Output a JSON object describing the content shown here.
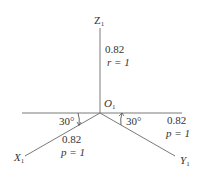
{
  "diagram": {
    "type": "axonometric-axes",
    "origin": {
      "label": "O",
      "subscript": "1"
    },
    "axes": [
      {
        "name": "Z",
        "subscript": "1",
        "scale": "0.82",
        "coef_symbol": "r",
        "coef_value": "1",
        "coef_text": "r = 1"
      },
      {
        "name": "X",
        "subscript": "1",
        "scale": "0.82",
        "coef_symbol": "p",
        "coef_value": "1",
        "coef_text": "p = 1"
      },
      {
        "name": "Y",
        "subscript": "1",
        "scale": "0.82",
        "coef_symbol": "p",
        "coef_value": "1",
        "coef_text": "p = 1"
      }
    ],
    "angles": [
      {
        "side": "left",
        "text": "30°"
      },
      {
        "side": "right",
        "text": "30°"
      }
    ],
    "colors": {
      "line": "#7a7a7a",
      "text": "#333333",
      "background": "#ffffff"
    }
  }
}
